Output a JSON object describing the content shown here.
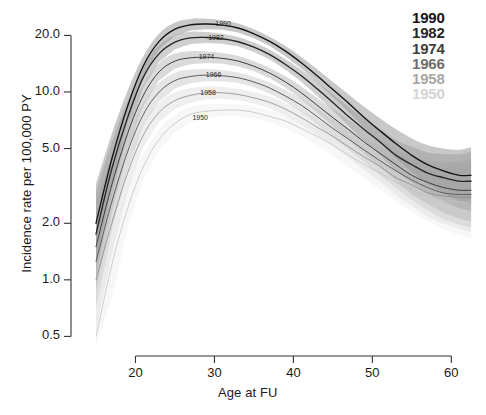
{
  "chart_data": {
    "type": "line",
    "title": "",
    "xlabel": "Age at FU",
    "ylabel": "Incidence rate per 100,000 PY",
    "xlim": [
      15,
      63
    ],
    "ylim": [
      0.45,
      26
    ],
    "yscale": "log",
    "grid": false,
    "legend_position": "top-right",
    "xticks": [
      20,
      30,
      40,
      50,
      60
    ],
    "xtick_labels": [
      "20",
      "30",
      "40",
      "50",
      "60"
    ],
    "yticks": [
      0.5,
      1.0,
      2.0,
      5.0,
      10.0,
      20.0
    ],
    "ytick_labels": [
      "0.5",
      "1.0",
      "2.0",
      "5.0",
      "10.0",
      "20.0"
    ],
    "x": [
      15,
      17,
      19,
      21,
      23,
      25,
      27,
      29,
      31,
      33,
      35,
      37,
      39,
      41,
      43,
      45,
      47,
      49,
      51,
      53,
      55,
      57,
      59,
      61,
      62.5
    ],
    "series": [
      {
        "name": "1990",
        "label": "1990",
        "color": "#141414",
        "band_color": "#9a9a9a",
        "inline_label": "1990",
        "peak_age": 30,
        "peak_value": 23.0,
        "values": [
          2.0,
          4.4,
          8.4,
          13.8,
          18.6,
          21.6,
          22.8,
          23.0,
          22.7,
          21.9,
          20.4,
          18.6,
          16.5,
          14.3,
          12.2,
          10.3,
          8.7,
          7.3,
          6.2,
          5.3,
          4.6,
          4.1,
          3.8,
          3.6,
          3.6
        ]
      },
      {
        "name": "1982",
        "label": "1982",
        "color": "#262626",
        "band_color": "#a8a8a8",
        "inline_label": "1982",
        "peak_age": 30,
        "peak_value": 19.5,
        "values": [
          1.75,
          3.9,
          7.3,
          12.0,
          16.0,
          18.4,
          19.4,
          19.5,
          19.2,
          18.5,
          17.3,
          15.8,
          14.0,
          12.2,
          10.4,
          8.8,
          7.4,
          6.3,
          5.4,
          4.6,
          4.1,
          3.7,
          3.5,
          3.35,
          3.35
        ]
      },
      {
        "name": "1974",
        "label": "1974",
        "color": "#3d3d3d",
        "band_color": "#bcbcbc",
        "inline_label": "1974",
        "peak_age": 31,
        "peak_value": 15.3,
        "values": [
          1.5,
          3.2,
          6.0,
          9.6,
          12.8,
          14.6,
          15.2,
          15.3,
          15.1,
          14.6,
          13.7,
          12.6,
          11.3,
          9.9,
          8.5,
          7.3,
          6.3,
          5.4,
          4.7,
          4.1,
          3.6,
          3.3,
          3.1,
          3.0,
          3.0
        ]
      },
      {
        "name": "1966",
        "label": "1966",
        "color": "#5e5e5e",
        "band_color": "#cfcfcf",
        "inline_label": "1966",
        "peak_age": 32,
        "peak_value": 12.3,
        "values": [
          1.25,
          2.6,
          4.8,
          7.6,
          10.0,
          11.5,
          12.1,
          12.3,
          12.2,
          11.9,
          11.3,
          10.5,
          9.5,
          8.5,
          7.4,
          6.4,
          5.6,
          4.9,
          4.3,
          3.8,
          3.4,
          3.1,
          2.9,
          2.85,
          2.85
        ]
      },
      {
        "name": "1958",
        "label": "1958",
        "color": "#8a8a8a",
        "band_color": "#e2e2e2",
        "inline_label": "1958",
        "peak_age": 33,
        "peak_value": 9.9,
        "values": [
          1.0,
          2.0,
          3.7,
          5.9,
          7.8,
          9.0,
          9.6,
          9.9,
          9.9,
          9.7,
          9.3,
          8.8,
          8.1,
          7.3,
          6.5,
          5.8,
          5.1,
          4.5,
          4.0,
          3.5,
          3.2,
          2.9,
          2.8,
          2.75,
          2.75
        ]
      },
      {
        "name": "1950",
        "label": "1950",
        "color": "#c2c2c2",
        "band_color": "#f0f0f0",
        "inline_label": "1950",
        "peak_age": 33,
        "peak_value": 8.0,
        "values": [
          0.5,
          1.2,
          2.4,
          4.0,
          5.6,
          6.8,
          7.6,
          7.9,
          8.0,
          8.0,
          7.8,
          7.4,
          7.0,
          6.4,
          5.8,
          5.2,
          4.6,
          4.1,
          3.7,
          3.3,
          3.0,
          2.8,
          2.65,
          2.6,
          2.6
        ]
      }
    ],
    "inline_curve_labels": [
      {
        "text": "1990",
        "age": 31.5,
        "value": 22.7
      },
      {
        "text": "1982",
        "age": 30.6,
        "value": 19.2
      },
      {
        "text": "1974",
        "age": 29.4,
        "value": 15.2
      },
      {
        "text": "1966",
        "age": 30.3,
        "value": 12.1
      },
      {
        "text": "1958",
        "age": 29.6,
        "value": 9.7
      },
      {
        "text": "1950",
        "age": 28.6,
        "value": 7.2
      }
    ]
  },
  "legend": {
    "items": [
      {
        "label": "1990",
        "color": "#141414"
      },
      {
        "label": "1982",
        "color": "#262626"
      },
      {
        "label": "1974",
        "color": "#3d3d3d"
      },
      {
        "label": "1966",
        "color": "#6e6e6e"
      },
      {
        "label": "1958",
        "color": "#a6a6a6"
      },
      {
        "label": "1950",
        "color": "#d4d4d4"
      }
    ]
  },
  "axes": {
    "x_title": "Age at FU",
    "y_title": "Incidence rate per 100,000 PY"
  }
}
